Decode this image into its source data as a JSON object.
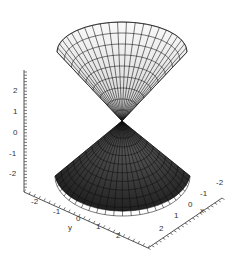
{
  "chart_data": {
    "type": "surface3d",
    "title": "",
    "xlabel": "x",
    "ylabel": "y",
    "zlabel": "",
    "x_ticks": [
      "-2",
      "-1",
      "0",
      "1",
      "2"
    ],
    "y_ticks": [
      "-2",
      "-1",
      "0",
      "1",
      "2"
    ],
    "z_ticks": [
      "2",
      "1",
      "0",
      "-1",
      "-2"
    ],
    "xlim": [
      -2.5,
      2.5
    ],
    "ylim": [
      -2.5,
      2.5
    ],
    "zlim": [
      -2.5,
      2.5
    ],
    "grid": false,
    "surfaces": [
      {
        "name": "upper cone",
        "z_range": [
          0,
          2.5
        ],
        "fill": "#f0f0f0",
        "mesh": "#222222"
      },
      {
        "name": "lower cone",
        "z_range": [
          -2.5,
          0
        ],
        "fill": "#2a2a2a",
        "mesh": "#111111"
      }
    ],
    "colors": {
      "upper_fill_light": "#fafafa",
      "upper_fill_dark": "#cfcfcf",
      "lower_fill_light": "#555555",
      "lower_fill_dark": "#151515",
      "axis": "#555555"
    }
  }
}
